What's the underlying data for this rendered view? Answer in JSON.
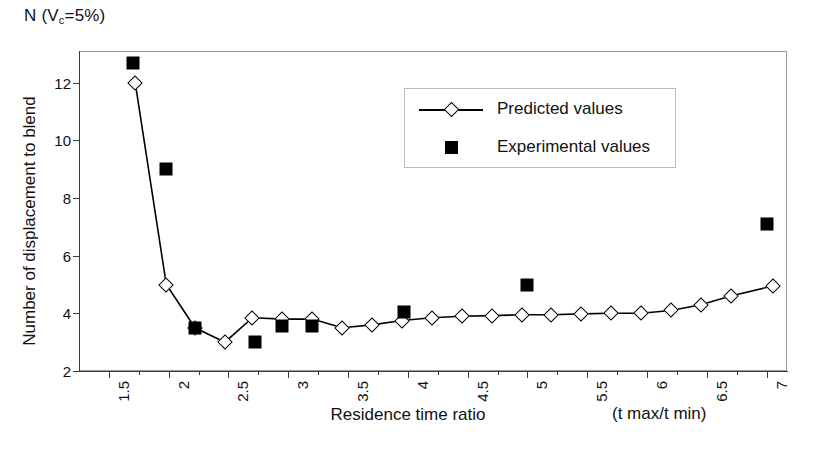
{
  "chart_data": {
    "type": "line",
    "title": "N (Vc=5%)",
    "title_prefix": "N (V",
    "title_sub": "c",
    "title_suffix": "=5%)",
    "xlabel": "Residence time ratio",
    "xunit": "(t max/t min)",
    "ylabel": "Number of displacement to blend",
    "xlim": [
      1.25,
      7.17
    ],
    "ylim": [
      2,
      13.1
    ],
    "grid": false,
    "legend_position": "inside-top-center",
    "x_ticks": [
      1.5,
      2,
      2.5,
      3,
      3.5,
      4,
      4.5,
      5,
      5.5,
      6,
      6.5,
      7
    ],
    "x_tick_labels": [
      "1.5",
      "2",
      "2.5",
      "3",
      "3.5",
      "4",
      "4.5",
      "5",
      "5.5",
      "6",
      "6.5",
      "7"
    ],
    "y_ticks": [
      2,
      4,
      6,
      8,
      10,
      12
    ],
    "y_tick_labels": [
      "2",
      "4",
      "6",
      "8",
      "10",
      "12"
    ],
    "series": [
      {
        "name": "Predicted values",
        "marker": "open-diamond",
        "line": true,
        "color": "#000000",
        "points": [
          [
            1.72,
            12.0
          ],
          [
            1.98,
            5.0
          ],
          [
            2.22,
            3.5
          ],
          [
            2.47,
            3.0
          ],
          [
            2.7,
            3.85
          ],
          [
            2.95,
            3.8
          ],
          [
            3.2,
            3.8
          ],
          [
            3.45,
            3.5
          ],
          [
            3.7,
            3.6
          ],
          [
            3.95,
            3.75
          ],
          [
            4.2,
            3.85
          ],
          [
            4.45,
            3.9
          ],
          [
            4.7,
            3.92
          ],
          [
            4.95,
            3.95
          ],
          [
            5.2,
            3.95
          ],
          [
            5.45,
            3.98
          ],
          [
            5.7,
            4.0
          ],
          [
            5.95,
            4.0
          ],
          [
            6.2,
            4.1
          ],
          [
            6.45,
            4.3
          ],
          [
            6.7,
            4.6
          ],
          [
            7.05,
            4.95
          ]
        ]
      },
      {
        "name": "Experimental values",
        "marker": "filled-square",
        "line": false,
        "color": "#000000",
        "points": [
          [
            1.7,
            12.7
          ],
          [
            1.98,
            9.0
          ],
          [
            2.22,
            3.5
          ],
          [
            2.72,
            3.0
          ],
          [
            2.95,
            3.55
          ],
          [
            3.2,
            3.55
          ],
          [
            3.97,
            4.05
          ],
          [
            5.0,
            5.0
          ],
          [
            7.0,
            7.1
          ]
        ]
      }
    ],
    "legend": [
      {
        "label": "Predicted values",
        "key": "line-diamond"
      },
      {
        "label": "Experimental values",
        "key": "filled-square"
      }
    ]
  }
}
